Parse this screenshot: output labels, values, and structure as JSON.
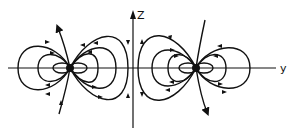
{
  "figure": {
    "type": "field-line diagram",
    "axes": {
      "horizontal_label": "y",
      "vertical_label": "Z"
    },
    "sources": [
      {
        "name": "left-source",
        "description": "point source on y-axis, left of z-axis"
      },
      {
        "name": "right-source",
        "description": "point source on y-axis, right of z-axis"
      }
    ],
    "colors": {
      "ink": "#111111",
      "background": "#ffffff"
    }
  }
}
